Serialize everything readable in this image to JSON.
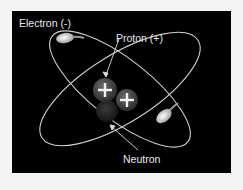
{
  "diagram": {
    "labels": {
      "electron": "Electron (-)",
      "proton": "Proton (+)",
      "neutron": "Neutron"
    },
    "particles": {
      "protons": 2,
      "neutrons": 1,
      "electrons": 2,
      "proton_symbol": "+"
    },
    "colors": {
      "background": "#000000",
      "orbit": "#cfcfcf",
      "proton": "#4a4a4a",
      "neutron": "#2a2a2a",
      "electron": "#e6e6e6",
      "text": "#e8e8e8"
    }
  }
}
